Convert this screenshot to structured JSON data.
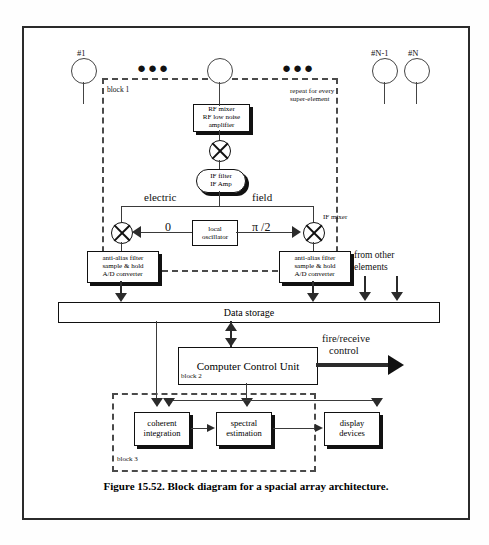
{
  "figure": {
    "caption": "Figure 15.52. Block diagram for a spacial array architecture."
  },
  "antennas": [
    {
      "label": "#1"
    },
    {
      "label": ""
    },
    {
      "label": "#N-1"
    },
    {
      "label": "#N"
    }
  ],
  "ellipsis": {
    "left": "●●●",
    "right": "●●●"
  },
  "blocks": {
    "block1_label": "block 1",
    "block2_label": "block 2",
    "block3_label": "block 3",
    "repeat_note_line1": "repeat for every",
    "repeat_note_line2": "super-element"
  },
  "components": {
    "rf_mixer": {
      "line1": "RF mixer",
      "line2": "RF low noise",
      "line3": "amplifier"
    },
    "if_filter": {
      "line1": "IF filter",
      "line2": "IF Amp"
    },
    "local_oscillator": {
      "line1": "local",
      "line2": "oscillator"
    },
    "adc_left": {
      "line1": "anti-alias filter",
      "line2": "sample & hold",
      "line3": "A/D converter"
    },
    "adc_right": {
      "line1": "anti-alias filter",
      "line2": "sample & hold",
      "line3": "A/D converter"
    },
    "data_storage": "Data storage",
    "computer_control_unit": "Computer Control Unit",
    "coherent_integration": {
      "line1": "coherent",
      "line2": "integration"
    },
    "spectral_estimation": {
      "line1": "spectral",
      "line2": "estimation"
    },
    "display_devices": {
      "line1": "display",
      "line2": "devices"
    }
  },
  "annotations": {
    "electric": "electric",
    "field": "field",
    "phase_zero": "0",
    "phase_quarter": "π /2",
    "if_mixer": "IF mixer",
    "from_other_elements_line1": "from other",
    "from_other_elements_line2": "elements",
    "fire_receive_line1": "fire/receive",
    "fire_receive_line2": "control"
  },
  "colors": {
    "ink": "#111111",
    "line": "#3a3a3a",
    "dashed": "#4a4a4a",
    "frame": "#2b2b2b",
    "paper": "#ffffff"
  }
}
